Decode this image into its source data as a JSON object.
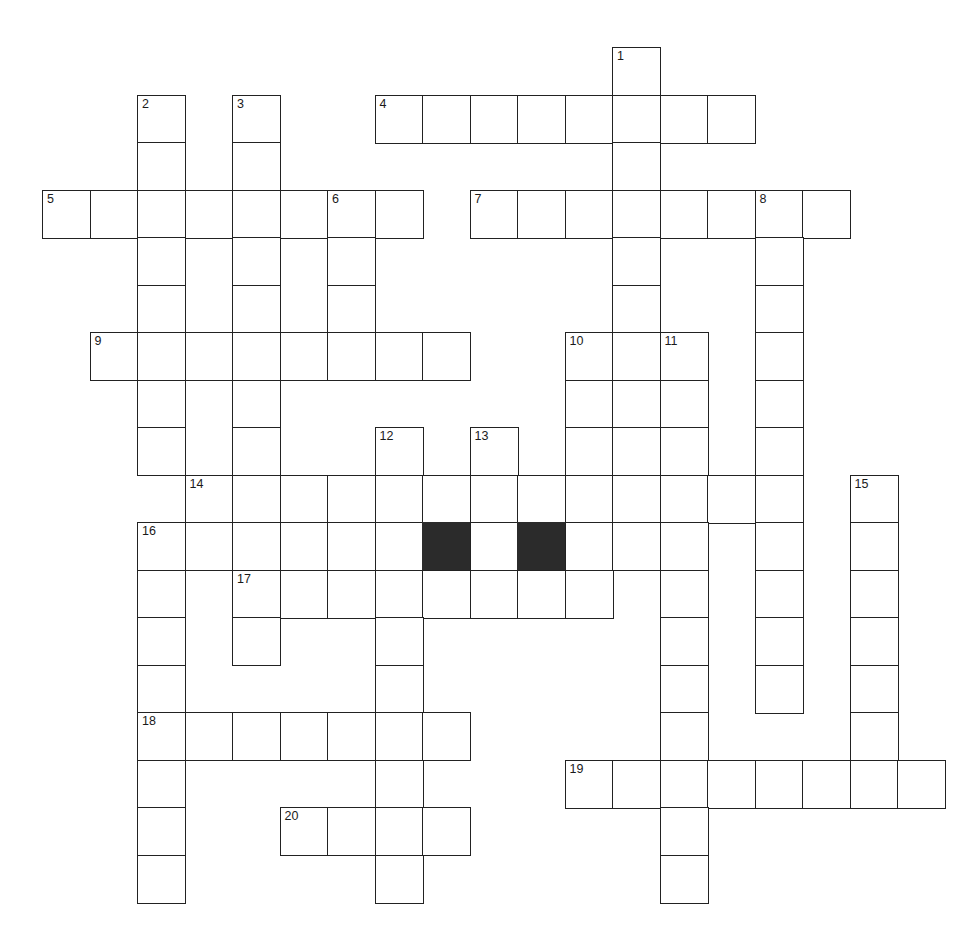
{
  "puzzle": {
    "type": "crossword-grid",
    "title": "",
    "cell_size": 47.5,
    "origin_x": 42,
    "origin_y": 47,
    "grid_colors": {
      "cell_fill": "#ffffff",
      "cell_border": "#222222",
      "block_fill": "#2b2b2b",
      "number_color": "#1a1a1a",
      "page_background": "#ffffff"
    },
    "clue_numbers": [
      "1",
      "2",
      "3",
      "4",
      "5",
      "6",
      "7",
      "8",
      "9",
      "10",
      "11",
      "12",
      "13",
      "14",
      "15",
      "16",
      "17",
      "18",
      "19",
      "20"
    ],
    "entries": [
      {
        "number": "1",
        "direction": "down",
        "col": 12,
        "row": 0,
        "length": 13
      },
      {
        "number": "2",
        "direction": "down",
        "col": 2,
        "row": 1,
        "length": 9
      },
      {
        "number": "3",
        "direction": "down",
        "col": 4,
        "row": 1,
        "length": 12
      },
      {
        "number": "4",
        "direction": "across",
        "col": 7,
        "row": 1,
        "length": 8
      },
      {
        "number": "5",
        "direction": "across",
        "col": 0,
        "row": 3,
        "length": 8
      },
      {
        "number": "6",
        "direction": "down",
        "col": 6,
        "row": 3,
        "length": 4
      },
      {
        "number": "7",
        "direction": "across",
        "col": 9,
        "row": 3,
        "length": 7
      },
      {
        "number": "8",
        "direction": "down",
        "col": 15,
        "row": 3,
        "length": 11
      },
      {
        "number": "9",
        "direction": "across",
        "col": 1,
        "row": 6,
        "length": 8
      },
      {
        "number": "10",
        "direction": "down",
        "col": 11,
        "row": 6,
        "length": 4
      },
      {
        "number": "11",
        "direction": "down",
        "col": 13,
        "row": 6,
        "length": 12
      },
      {
        "number": "12",
        "direction": "down",
        "col": 7,
        "row": 8,
        "length": 10
      },
      {
        "number": "13",
        "direction": "down",
        "col": 9,
        "row": 8,
        "length": 4
      },
      {
        "number": "14",
        "direction": "across",
        "col": 3,
        "row": 9,
        "length": 13
      },
      {
        "number": "15",
        "direction": "down",
        "col": 17,
        "row": 9,
        "length": 8
      },
      {
        "number": "16",
        "direction": "down",
        "col": 2,
        "row": 10,
        "length": 9
      },
      {
        "number": "17",
        "direction": "across",
        "col": 4,
        "row": 11,
        "length": 8
      },
      {
        "number": "18",
        "direction": "across",
        "col": 2,
        "row": 14,
        "length": 7
      },
      {
        "number": "19",
        "direction": "across",
        "col": 11,
        "row": 15,
        "length": 8
      },
      {
        "number": "20",
        "direction": "across",
        "col": 5,
        "row": 16,
        "length": 4
      }
    ],
    "cells": [
      {
        "col": 12,
        "row": 0,
        "num": "1"
      },
      {
        "col": 2,
        "row": 1,
        "num": "2"
      },
      {
        "col": 4,
        "row": 1,
        "num": "3"
      },
      {
        "col": 7,
        "row": 1,
        "num": "4"
      },
      {
        "col": 8,
        "row": 1
      },
      {
        "col": 9,
        "row": 1
      },
      {
        "col": 10,
        "row": 1
      },
      {
        "col": 11,
        "row": 1
      },
      {
        "col": 12,
        "row": 1
      },
      {
        "col": 13,
        "row": 1
      },
      {
        "col": 14,
        "row": 1
      },
      {
        "col": 2,
        "row": 2
      },
      {
        "col": 4,
        "row": 2
      },
      {
        "col": 12,
        "row": 2
      },
      {
        "col": 0,
        "row": 3,
        "num": "5"
      },
      {
        "col": 1,
        "row": 3
      },
      {
        "col": 2,
        "row": 3
      },
      {
        "col": 3,
        "row": 3
      },
      {
        "col": 4,
        "row": 3
      },
      {
        "col": 5,
        "row": 3
      },
      {
        "col": 6,
        "row": 3,
        "num": "6"
      },
      {
        "col": 7,
        "row": 3
      },
      {
        "col": 9,
        "row": 3,
        "num": "7"
      },
      {
        "col": 10,
        "row": 3
      },
      {
        "col": 11,
        "row": 3
      },
      {
        "col": 12,
        "row": 3
      },
      {
        "col": 13,
        "row": 3
      },
      {
        "col": 14,
        "row": 3
      },
      {
        "col": 15,
        "row": 3,
        "num": "8"
      },
      {
        "col": 16,
        "row": 3
      },
      {
        "col": 2,
        "row": 4
      },
      {
        "col": 4,
        "row": 4
      },
      {
        "col": 6,
        "row": 4
      },
      {
        "col": 12,
        "row": 4
      },
      {
        "col": 15,
        "row": 4
      },
      {
        "col": 2,
        "row": 5
      },
      {
        "col": 4,
        "row": 5
      },
      {
        "col": 6,
        "row": 5
      },
      {
        "col": 12,
        "row": 5
      },
      {
        "col": 15,
        "row": 5
      },
      {
        "col": 1,
        "row": 6,
        "num": "9"
      },
      {
        "col": 2,
        "row": 6
      },
      {
        "col": 3,
        "row": 6
      },
      {
        "col": 4,
        "row": 6
      },
      {
        "col": 5,
        "row": 6
      },
      {
        "col": 6,
        "row": 6
      },
      {
        "col": 7,
        "row": 6
      },
      {
        "col": 8,
        "row": 6
      },
      {
        "col": 11,
        "row": 6,
        "num": "10"
      },
      {
        "col": 12,
        "row": 6
      },
      {
        "col": 13,
        "row": 6,
        "num": "11"
      },
      {
        "col": 15,
        "row": 6
      },
      {
        "col": 2,
        "row": 7
      },
      {
        "col": 4,
        "row": 7
      },
      {
        "col": 11,
        "row": 7
      },
      {
        "col": 12,
        "row": 7
      },
      {
        "col": 13,
        "row": 7
      },
      {
        "col": 15,
        "row": 7
      },
      {
        "col": 2,
        "row": 8
      },
      {
        "col": 4,
        "row": 8
      },
      {
        "col": 7,
        "row": 8,
        "num": "12"
      },
      {
        "col": 9,
        "row": 8,
        "num": "13"
      },
      {
        "col": 11,
        "row": 8
      },
      {
        "col": 12,
        "row": 8
      },
      {
        "col": 13,
        "row": 8
      },
      {
        "col": 15,
        "row": 8
      },
      {
        "col": 3,
        "row": 9,
        "num": "14"
      },
      {
        "col": 4,
        "row": 9
      },
      {
        "col": 5,
        "row": 9
      },
      {
        "col": 6,
        "row": 9
      },
      {
        "col": 7,
        "row": 9
      },
      {
        "col": 8,
        "row": 9
      },
      {
        "col": 9,
        "row": 9
      },
      {
        "col": 10,
        "row": 9
      },
      {
        "col": 11,
        "row": 9
      },
      {
        "col": 12,
        "row": 9
      },
      {
        "col": 13,
        "row": 9
      },
      {
        "col": 14,
        "row": 9
      },
      {
        "col": 15,
        "row": 9
      },
      {
        "col": 17,
        "row": 9,
        "num": "15"
      },
      {
        "col": 2,
        "row": 10,
        "num": "16"
      },
      {
        "col": 3,
        "row": 10
      },
      {
        "col": 4,
        "row": 10
      },
      {
        "col": 5,
        "row": 10
      },
      {
        "col": 6,
        "row": 10
      },
      {
        "col": 7,
        "row": 10
      },
      {
        "col": 8,
        "row": 10,
        "block": true
      },
      {
        "col": 9,
        "row": 10
      },
      {
        "col": 10,
        "row": 10,
        "block": true
      },
      {
        "col": 11,
        "row": 10
      },
      {
        "col": 12,
        "row": 10
      },
      {
        "col": 13,
        "row": 10
      },
      {
        "col": 15,
        "row": 10
      },
      {
        "col": 17,
        "row": 10
      },
      {
        "col": 2,
        "row": 11
      },
      {
        "col": 4,
        "row": 11,
        "num": "17"
      },
      {
        "col": 5,
        "row": 11
      },
      {
        "col": 6,
        "row": 11
      },
      {
        "col": 7,
        "row": 11
      },
      {
        "col": 8,
        "row": 11
      },
      {
        "col": 9,
        "row": 11
      },
      {
        "col": 10,
        "row": 11
      },
      {
        "col": 11,
        "row": 11
      },
      {
        "col": 13,
        "row": 11
      },
      {
        "col": 15,
        "row": 11
      },
      {
        "col": 17,
        "row": 11
      },
      {
        "col": 2,
        "row": 12
      },
      {
        "col": 4,
        "row": 12
      },
      {
        "col": 7,
        "row": 12
      },
      {
        "col": 13,
        "row": 12
      },
      {
        "col": 15,
        "row": 12
      },
      {
        "col": 17,
        "row": 12
      },
      {
        "col": 2,
        "row": 13
      },
      {
        "col": 7,
        "row": 13
      },
      {
        "col": 13,
        "row": 13
      },
      {
        "col": 15,
        "row": 13
      },
      {
        "col": 17,
        "row": 13
      },
      {
        "col": 2,
        "row": 14,
        "num": "18"
      },
      {
        "col": 3,
        "row": 14
      },
      {
        "col": 4,
        "row": 14
      },
      {
        "col": 5,
        "row": 14
      },
      {
        "col": 6,
        "row": 14
      },
      {
        "col": 7,
        "row": 14
      },
      {
        "col": 8,
        "row": 14
      },
      {
        "col": 13,
        "row": 14
      },
      {
        "col": 17,
        "row": 14
      },
      {
        "col": 2,
        "row": 15
      },
      {
        "col": 7,
        "row": 15
      },
      {
        "col": 11,
        "row": 15,
        "num": "19"
      },
      {
        "col": 12,
        "row": 15
      },
      {
        "col": 13,
        "row": 15
      },
      {
        "col": 14,
        "row": 15
      },
      {
        "col": 15,
        "row": 15
      },
      {
        "col": 16,
        "row": 15
      },
      {
        "col": 17,
        "row": 15
      },
      {
        "col": 18,
        "row": 15
      },
      {
        "col": 2,
        "row": 16
      },
      {
        "col": 5,
        "row": 16,
        "num": "20"
      },
      {
        "col": 6,
        "row": 16
      },
      {
        "col": 7,
        "row": 16
      },
      {
        "col": 8,
        "row": 16
      },
      {
        "col": 13,
        "row": 16
      },
      {
        "col": 2,
        "row": 17
      },
      {
        "col": 7,
        "row": 17
      },
      {
        "col": 13,
        "row": 17
      }
    ]
  }
}
